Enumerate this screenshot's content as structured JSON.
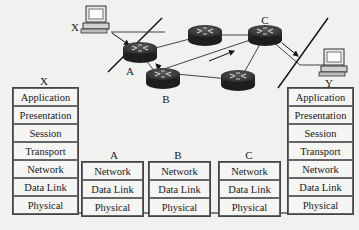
{
  "network": {
    "hosts": [
      {
        "id": "X",
        "label": "X"
      },
      {
        "id": "Y",
        "label": "Y"
      }
    ],
    "routers": [
      {
        "id": "A",
        "label": "A"
      },
      {
        "id": "B",
        "label": "B"
      },
      {
        "id": "C",
        "label": "C"
      },
      {
        "id": "R4",
        "label": ""
      },
      {
        "id": "R5",
        "label": ""
      }
    ]
  },
  "stacks": {
    "X": {
      "title": "X",
      "layers": [
        "Application",
        "Presentation",
        "Session",
        "Transport",
        "Network",
        "Data Link",
        "Physical"
      ]
    },
    "A": {
      "title": "A",
      "layers": [
        "Network",
        "Data Link",
        "Physical"
      ]
    },
    "B": {
      "title": "B",
      "layers": [
        "Network",
        "Data Link",
        "Physical"
      ]
    },
    "C": {
      "title": "C",
      "layers": [
        "Network",
        "Data Link",
        "Physical"
      ]
    },
    "Y": {
      "title": "Y",
      "layers": [
        "Application",
        "Presentation",
        "Session",
        "Transport",
        "Network",
        "Data Link",
        "Physical"
      ]
    }
  },
  "colors": {
    "background": "#f1f1ef",
    "router_body": "#2f2f2f",
    "router_top": "#4a4a4a",
    "line": "#222222"
  }
}
